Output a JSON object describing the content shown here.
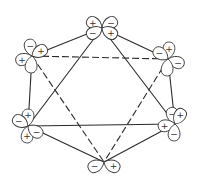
{
  "diagram": {
    "colors": {
      "line": "#2a2a2a",
      "background": "#ffffff"
    },
    "vertices": [
      {
        "id": "v1",
        "x": 102,
        "y": 28
      },
      {
        "id": "v2",
        "x": 32,
        "y": 56
      },
      {
        "id": "v3",
        "x": 168,
        "y": 59
      },
      {
        "id": "v4",
        "x": 28,
        "y": 126
      },
      {
        "id": "v5",
        "x": 175,
        "y": 124
      },
      {
        "id": "v6",
        "x": 104,
        "y": 162
      }
    ],
    "hexagon_edges": [
      [
        "v1",
        "v2"
      ],
      [
        "v1",
        "v3"
      ],
      [
        "v3",
        "v5"
      ],
      [
        "v5",
        "v6"
      ],
      [
        "v6",
        "v4"
      ],
      [
        "v4",
        "v2"
      ]
    ],
    "solid_triangle": [
      [
        "v1",
        "v4"
      ],
      [
        "v1",
        "v5"
      ],
      [
        "v4",
        "v5"
      ]
    ],
    "dashed_triangle": [
      [
        "v2",
        "v3"
      ],
      [
        "v2",
        "v6"
      ],
      [
        "v3",
        "v6"
      ]
    ],
    "orbitals": {
      "v1": [
        {
          "angle": -150,
          "sign": "+"
        },
        {
          "angle": -30,
          "sign": "−"
        },
        {
          "angle": 150,
          "sign": "−"
        },
        {
          "angle": 30,
          "sign": "+"
        }
      ],
      "v2": [
        {
          "angle": -100,
          "sign": "−"
        },
        {
          "angle": -30,
          "sign": "+"
        },
        {
          "angle": 160,
          "sign": "+"
        },
        {
          "angle": 95,
          "sign": ""
        }
      ],
      "v3": [
        {
          "angle": -85,
          "sign": "+"
        },
        {
          "angle": -145,
          "sign": "−"
        },
        {
          "angle": 20,
          "sign": "−"
        },
        {
          "angle": 95,
          "sign": ""
        }
      ],
      "v4": [
        {
          "angle": -90,
          "sign": "+"
        },
        {
          "angle": -150,
          "sign": "−"
        },
        {
          "angle": 95,
          "sign": "+"
        },
        {
          "angle": 35,
          "sign": "−"
        }
      ],
      "v5": [
        {
          "angle": -105,
          "sign": "−"
        },
        {
          "angle": -60,
          "sign": "+"
        },
        {
          "angle": 170,
          "sign": "+"
        },
        {
          "angle": 95,
          "sign": "−"
        }
      ],
      "v6": [
        {
          "angle": 155,
          "sign": "−"
        },
        {
          "angle": 25,
          "sign": "+"
        }
      ]
    },
    "labels": {
      "plus": "+",
      "minus": "−"
    }
  }
}
